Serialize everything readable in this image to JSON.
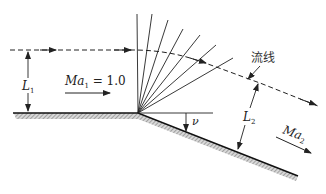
{
  "diagram": {
    "type": "Prandtl-Meyer expansion fan over convex corner",
    "labels": {
      "upstream_mach": "Ma₁ = 1.0",
      "upstream_mach_main": "Ma",
      "upstream_mach_sub": "1",
      "upstream_mach_eq": " = 1.0",
      "downstream_mach_main": "Ma",
      "downstream_mach_sub": "2",
      "streamline": "流线",
      "l1_main": "L",
      "l1_sub": "1",
      "l2_main": "L",
      "l2_sub": "2",
      "turn_angle": "ν"
    },
    "fan_line_count": 7,
    "colors": {
      "line": "#222222",
      "hatch": "#888888"
    }
  }
}
